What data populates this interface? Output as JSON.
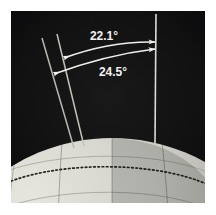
{
  "figure": {
    "frame": {
      "background_color": "#ffffff",
      "panel_color": "#0d0d0f",
      "panel_x": 11,
      "panel_y": 11,
      "panel_width": 194,
      "panel_height": 192
    },
    "annotations": {
      "tilt_upper": {
        "label": "22.1°",
        "value": 22.1,
        "unit": "degrees",
        "text_x": 104,
        "text_y": 40,
        "color": "#f2f2f2"
      },
      "tilt_lower": {
        "label": "24.5°",
        "value": 24.5,
        "unit": "degrees",
        "text_x": 113,
        "text_y": 76,
        "color": "#f2f2f2"
      }
    },
    "lines": {
      "reference_vertical": {
        "name": "orbital-normal-line",
        "color": "#d8d8d2",
        "x1": 156,
        "y1": 14,
        "x2": 155,
        "y2": 143
      },
      "axis_min_tilt": {
        "name": "axis-line-min-tilt",
        "color": "#b9b9ae",
        "x1": 42,
        "y1": 38,
        "x2": 74,
        "y2": 148
      },
      "axis_max_tilt": {
        "name": "axis-line-max-tilt",
        "color": "#b9b9ae",
        "x1": 57,
        "y1": 34,
        "x2": 84,
        "y2": 146
      }
    },
    "arcs": {
      "arc_upper": {
        "name": "angle-arc-22",
        "color": "#f0f0ea",
        "start_x": 64,
        "start_y": 58,
        "ctrl_x": 110,
        "ctrl_y": 43,
        "end_x": 155,
        "end_y": 42
      },
      "arc_lower": {
        "name": "angle-arc-24",
        "color": "#f0f0ea",
        "start_x": 54,
        "start_y": 74,
        "ctrl_x": 106,
        "ctrl_y": 56,
        "end_x": 155,
        "end_y": 49
      }
    },
    "planet": {
      "name": "planet-sphere",
      "center_x": 112,
      "center_y": 330,
      "radius": 192,
      "surface_light": "#d9d9d2",
      "surface_dark": "#8d8d86",
      "grid_color": "#6f6f68",
      "equator_style": "dotted",
      "equator_color": "#2a2a28"
    }
  }
}
